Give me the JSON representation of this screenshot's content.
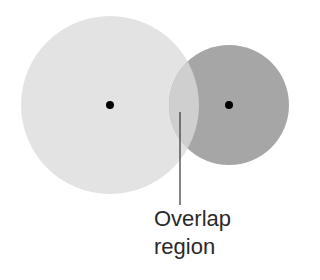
{
  "diagram": {
    "large_circle": {
      "cx": 110,
      "cy": 105,
      "r": 89,
      "color": "#e3e3e3"
    },
    "small_circle": {
      "cx": 229,
      "cy": 105,
      "r": 60,
      "color": "#a6a6a6"
    },
    "overlap_color": "#cfcfcf",
    "center_dot_color": "#000000",
    "label_line": {
      "x": 180,
      "y1": 112,
      "y2": 205
    },
    "label": {
      "line1": "Overlap",
      "line2": "region"
    }
  }
}
